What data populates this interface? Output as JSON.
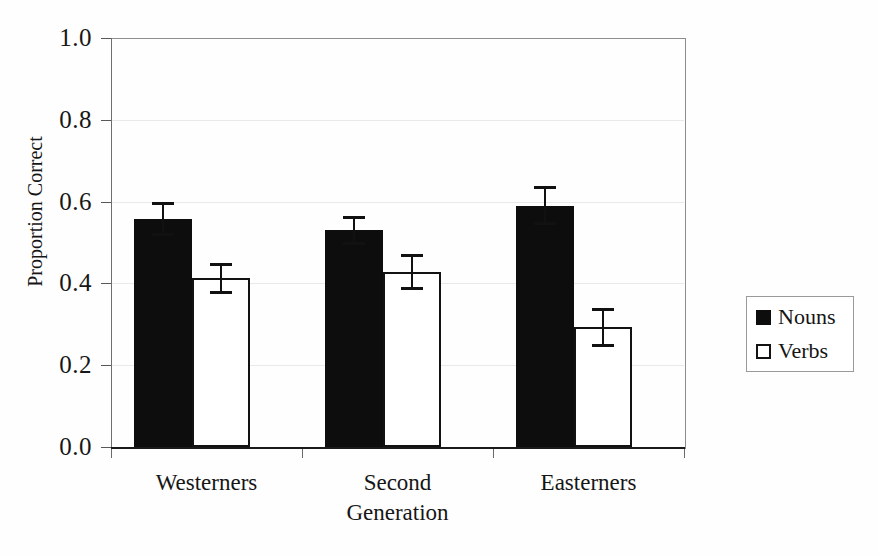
{
  "chart_data": {
    "type": "bar",
    "title": "",
    "subtitle": "",
    "xlabel": "",
    "ylabel": "Proportion Correct",
    "categories": [
      "Westerners",
      "Second Generation",
      "Easterners"
    ],
    "category_lines": [
      [
        "Westerners"
      ],
      [
        "Second",
        "Generation"
      ],
      [
        "Easterners"
      ]
    ],
    "series": [
      {
        "name": "Nouns",
        "color": "#0d0d0d",
        "fill": "solid",
        "values": [
          0.557,
          0.53,
          0.59
        ],
        "errors": [
          0.042,
          0.035,
          0.047
        ]
      },
      {
        "name": "Verbs",
        "color": "#ffffff",
        "fill": "open",
        "values": [
          0.413,
          0.428,
          0.293
        ],
        "errors": [
          0.038,
          0.045,
          0.048
        ]
      }
    ],
    "ylim": [
      0.0,
      1.0
    ],
    "yticks": [
      0.0,
      0.2,
      0.4,
      0.6,
      0.8,
      1.0
    ],
    "ytick_labels": [
      "0.0",
      "0.2",
      "0.4",
      "0.6",
      "0.8",
      "1.0"
    ],
    "grid": true,
    "grid_axis": "y",
    "legend": {
      "position": "right",
      "entries": [
        {
          "label": "Nouns",
          "swatch": "filled-square"
        },
        {
          "label": "Verbs",
          "swatch": "open-square"
        }
      ]
    },
    "error_bar_style": "capped-t",
    "background": "#ffffff",
    "frame_color": "#8d8d8d"
  }
}
